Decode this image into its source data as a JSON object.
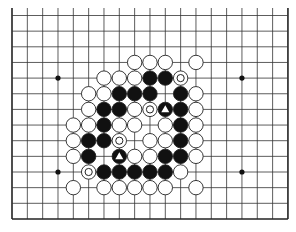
{
  "board": {
    "cols": 19,
    "rows": 14,
    "origin_x": 12,
    "origin_y": 15.5,
    "spacing_x": 15.33,
    "spacing_y": 15.65,
    "bottom_border_y": 219,
    "open_top": true,
    "line_color": "#333333",
    "border_color": "#222222",
    "star_points": [
      [
        3,
        4
      ],
      [
        15,
        4
      ],
      [
        3,
        10
      ],
      [
        15,
        10
      ]
    ]
  },
  "colors": {
    "black_stone": "#111111",
    "white_stone": "#ffffff",
    "stone_outline": "#222222"
  },
  "stones": [
    {
      "c": 8,
      "r": 3,
      "color": "white"
    },
    {
      "c": 9,
      "r": 3,
      "color": "white"
    },
    {
      "c": 10,
      "r": 3,
      "color": "white"
    },
    {
      "c": 12,
      "r": 3,
      "color": "white"
    },
    {
      "c": 6,
      "r": 4,
      "color": "white"
    },
    {
      "c": 7,
      "r": 4,
      "color": "white"
    },
    {
      "c": 8,
      "r": 4,
      "color": "white"
    },
    {
      "c": 9,
      "r": 4,
      "color": "black"
    },
    {
      "c": 10,
      "r": 4,
      "color": "black"
    },
    {
      "c": 11,
      "r": 4,
      "color": "white",
      "mark": "circle"
    },
    {
      "c": 5,
      "r": 5,
      "color": "white"
    },
    {
      "c": 6,
      "r": 5,
      "color": "white"
    },
    {
      "c": 7,
      "r": 5,
      "color": "black"
    },
    {
      "c": 8,
      "r": 5,
      "color": "black"
    },
    {
      "c": 9,
      "r": 5,
      "color": "black"
    },
    {
      "c": 11,
      "r": 5,
      "color": "black"
    },
    {
      "c": 12,
      "r": 5,
      "color": "white"
    },
    {
      "c": 5,
      "r": 6,
      "color": "white"
    },
    {
      "c": 6,
      "r": 6,
      "color": "black"
    },
    {
      "c": 7,
      "r": 6,
      "color": "black"
    },
    {
      "c": 8,
      "r": 6,
      "color": "white"
    },
    {
      "c": 9,
      "r": 6,
      "color": "white",
      "mark": "circle"
    },
    {
      "c": 10,
      "r": 6,
      "color": "black",
      "mark": "triangle"
    },
    {
      "c": 11,
      "r": 6,
      "color": "black"
    },
    {
      "c": 12,
      "r": 6,
      "color": "white"
    },
    {
      "c": 4,
      "r": 7,
      "color": "white"
    },
    {
      "c": 5,
      "r": 7,
      "color": "white"
    },
    {
      "c": 6,
      "r": 7,
      "color": "black"
    },
    {
      "c": 7,
      "r": 7,
      "color": "white"
    },
    {
      "c": 8,
      "r": 7,
      "color": "white"
    },
    {
      "c": 10,
      "r": 7,
      "color": "white"
    },
    {
      "c": 11,
      "r": 7,
      "color": "black"
    },
    {
      "c": 12,
      "r": 7,
      "color": "white"
    },
    {
      "c": 4,
      "r": 8,
      "color": "white"
    },
    {
      "c": 5,
      "r": 8,
      "color": "black"
    },
    {
      "c": 6,
      "r": 8,
      "color": "black"
    },
    {
      "c": 7,
      "r": 8,
      "color": "white",
      "mark": "circle"
    },
    {
      "c": 9,
      "r": 8,
      "color": "white"
    },
    {
      "c": 10,
      "r": 8,
      "color": "white"
    },
    {
      "c": 11,
      "r": 8,
      "color": "black"
    },
    {
      "c": 12,
      "r": 8,
      "color": "white"
    },
    {
      "c": 4,
      "r": 9,
      "color": "white"
    },
    {
      "c": 5,
      "r": 9,
      "color": "black"
    },
    {
      "c": 7,
      "r": 9,
      "color": "black",
      "mark": "triangle"
    },
    {
      "c": 8,
      "r": 9,
      "color": "white"
    },
    {
      "c": 9,
      "r": 9,
      "color": "white"
    },
    {
      "c": 10,
      "r": 9,
      "color": "black"
    },
    {
      "c": 11,
      "r": 9,
      "color": "black"
    },
    {
      "c": 12,
      "r": 9,
      "color": "white"
    },
    {
      "c": 5,
      "r": 10,
      "color": "white",
      "mark": "circle"
    },
    {
      "c": 6,
      "r": 10,
      "color": "black"
    },
    {
      "c": 7,
      "r": 10,
      "color": "black"
    },
    {
      "c": 8,
      "r": 10,
      "color": "black"
    },
    {
      "c": 9,
      "r": 10,
      "color": "black"
    },
    {
      "c": 10,
      "r": 10,
      "color": "black"
    },
    {
      "c": 11,
      "r": 10,
      "color": "white"
    },
    {
      "c": 4,
      "r": 11,
      "color": "white"
    },
    {
      "c": 6,
      "r": 11,
      "color": "white"
    },
    {
      "c": 7,
      "r": 11,
      "color": "white"
    },
    {
      "c": 8,
      "r": 11,
      "color": "white"
    },
    {
      "c": 9,
      "r": 11,
      "color": "white"
    },
    {
      "c": 10,
      "r": 11,
      "color": "white"
    },
    {
      "c": 12,
      "r": 11,
      "color": "white"
    }
  ]
}
